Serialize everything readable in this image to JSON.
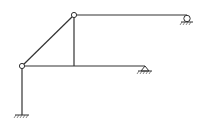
{
  "diagram": {
    "type": "structural-frame",
    "colors": {
      "line": "#333333",
      "background": "#ffffff"
    },
    "nodes": [
      {
        "id": "top-hinge",
        "x": 74,
        "y": 15,
        "kind": "hinge"
      },
      {
        "id": "left-hinge",
        "x": 22,
        "y": 66,
        "kind": "hinge"
      },
      {
        "id": "top-right-end",
        "x": 187,
        "y": 15,
        "kind": "roller-support"
      },
      {
        "id": "mid-right-end",
        "x": 145,
        "y": 66,
        "kind": "pin-support"
      },
      {
        "id": "mid-junction",
        "x": 74,
        "y": 66,
        "kind": "rigid"
      },
      {
        "id": "base",
        "x": 22,
        "y": 115,
        "kind": "fixed-support"
      }
    ],
    "members": [
      {
        "id": "top-beam",
        "from": "top-hinge",
        "to": "top-right-end"
      },
      {
        "id": "diagonal",
        "from": "left-hinge",
        "to": "top-hinge"
      },
      {
        "id": "vertical-strut",
        "from": "top-hinge",
        "to": "mid-junction"
      },
      {
        "id": "mid-beam",
        "from": "left-hinge",
        "to": "mid-right-end"
      },
      {
        "id": "left-column",
        "from": "left-hinge",
        "to": "base"
      }
    ]
  }
}
